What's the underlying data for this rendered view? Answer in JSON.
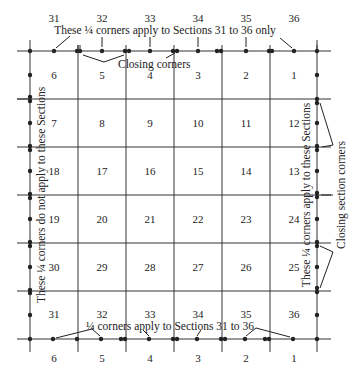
{
  "diagram": {
    "type": "township-survey-plat",
    "grid": {
      "rows": [
        [
          "6",
          "5",
          "4",
          "3",
          "2",
          "1"
        ],
        [
          "7",
          "8",
          "9",
          "10",
          "11",
          "12"
        ],
        [
          "18",
          "17",
          "16",
          "15",
          "14",
          "13"
        ],
        [
          "19",
          "20",
          "21",
          "22",
          "23",
          "24"
        ],
        [
          "30",
          "29",
          "28",
          "27",
          "26",
          "25"
        ],
        [
          "31",
          "32",
          "33",
          "34",
          "35",
          "36"
        ]
      ]
    },
    "top_labels": [
      "31",
      "32",
      "33",
      "34",
      "35",
      "36"
    ],
    "bottom_labels": [
      "6",
      "5",
      "4",
      "3",
      "2",
      "1"
    ],
    "annotations": {
      "top_quarter": "These ¼ corners apply to Sections 31 to 36 only",
      "closing_corners": "Closing corners",
      "bottom_quarter": "¼ corners apply to Sections 31 to 36",
      "left_vertical": "These ¼ corners do not apply to these Sections",
      "right_vertical": "These ¼ corners apply to these Sections",
      "closing_section_corners": "Closing section corners"
    }
  }
}
